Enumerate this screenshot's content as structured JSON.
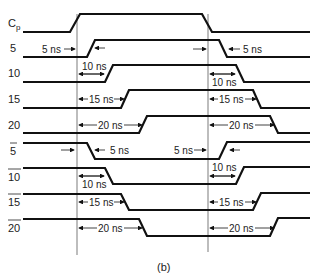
{
  "caption": "(b)",
  "signals": [
    {
      "label": "C",
      "sub": "p",
      "bar": false
    },
    {
      "label": "5",
      "bar": false
    },
    {
      "label": "10",
      "bar": false
    },
    {
      "label": "15",
      "bar": false
    },
    {
      "label": "20",
      "bar": false
    },
    {
      "label": "5",
      "bar": true
    },
    {
      "label": "10",
      "bar": true
    },
    {
      "label": "15",
      "bar": true
    },
    {
      "label": "20",
      "bar": true
    }
  ],
  "annotations": {
    "d5": "5 ns",
    "d10": "10 ns",
    "d15": "15 ns",
    "d20": "20 ns"
  }
}
